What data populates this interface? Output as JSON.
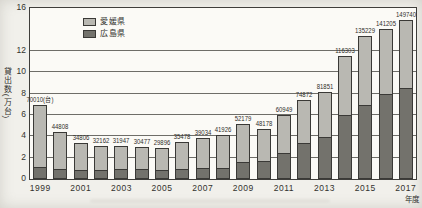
{
  "page": {
    "background_color": "#f1f0eb"
  },
  "chart_data": {
    "type": "bar",
    "stacked": true,
    "title": "",
    "xlabel": "年度",
    "ylabel": "貸出数(万台)",
    "ylim": [
      0,
      16
    ],
    "y_tick_labels": [
      16,
      12,
      10,
      8,
      6,
      4,
      2,
      0
    ],
    "gridline_values": [
      2,
      4,
      6,
      8,
      10,
      12
    ],
    "grid": true,
    "legend_position": "top-inside-left",
    "x": [
      1999,
      2000,
      2001,
      2002,
      2003,
      2004,
      2005,
      2006,
      2007,
      2008,
      2009,
      2010,
      2011,
      2012,
      2013,
      2014,
      2015,
      2016,
      2017
    ],
    "x_tick_labels": [
      "1999",
      "2001",
      "2003",
      "2005",
      "2007",
      "2009",
      "2011",
      "2013",
      "2015",
      "2017"
    ],
    "series": [
      {
        "name": "愛媛県",
        "position": "top-segment",
        "color": "#b9b8b2",
        "values": [
          5.9,
          3.58,
          2.68,
          2.37,
          2.29,
          2.15,
          2.14,
          2.65,
          2.85,
          3.19,
          3.62,
          3.12,
          3.64,
          4.09,
          4.24,
          5.68,
          6.62,
          6.12,
          6.47
        ]
      },
      {
        "name": "広島県",
        "position": "bottom-segment",
        "color": "#73726c",
        "values": [
          1.1,
          0.9,
          0.8,
          0.85,
          0.9,
          0.9,
          0.85,
          0.9,
          1.05,
          1.0,
          1.6,
          1.7,
          2.45,
          3.4,
          3.95,
          5.95,
          6.9,
          8.0,
          8.5
        ]
      }
    ],
    "total_labels": [
      "70010(台)",
      "44808",
      "34806",
      "32162",
      "31947",
      "30477",
      "29896",
      "35478",
      "39034",
      "41926",
      "52179",
      "48178",
      "60949",
      "74872",
      "81851",
      "116303",
      "135229",
      "141205",
      "149740"
    ],
    "totals_unit": "台"
  }
}
